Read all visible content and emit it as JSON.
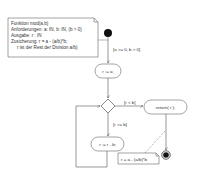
{
  "diagram": {
    "type": "uml-activity",
    "note_main": {
      "lines": [
        "Funktion mod(a,b)",
        "Anforderungen: a: IN, b: IN, (b > 0)",
        "Ausgabe: r : IN",
        "Zusicherung: r = a - (a/b)*b;",
        "r ist der Rest der Division a/b)"
      ]
    },
    "guards": {
      "start": "[a >= 0, b > 0]",
      "less": "[r < b]",
      "greater_equal": "[r >= b]"
    },
    "activities": {
      "init": "r := a;",
      "return": "return( r );",
      "subtract": "r := r - b;"
    },
    "note_result": {
      "text": "r = a - (a/b)*b"
    },
    "colors": {
      "line": "#555555",
      "node": "#111111",
      "box_border": "#666666"
    }
  }
}
